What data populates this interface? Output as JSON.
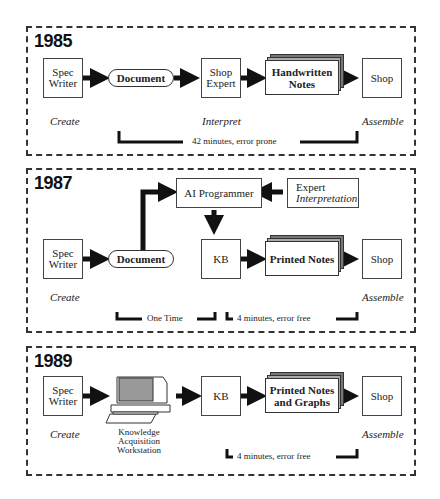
{
  "panels": [
    {
      "year": "1985",
      "nodes": {
        "spec_writer": "Spec Writer",
        "document": "Document",
        "shop_expert": "Shop Expert",
        "notes": "Handwritten Notes",
        "shop": "Shop"
      },
      "stages": {
        "create": "Create",
        "interpret": "Interpret",
        "assemble": "Assemble"
      },
      "timing": "42 minutes, error prone"
    },
    {
      "year": "1987",
      "nodes": {
        "ai_programmer": "AI Programmer",
        "expert_line1": "Expert",
        "expert_line2": "Interpretation",
        "spec_writer": "Spec Writer",
        "document": "Document",
        "kb": "KB",
        "notes": "Printed Notes",
        "shop": "Shop"
      },
      "stages": {
        "create": "Create",
        "assemble": "Assemble"
      },
      "timing_one": "One Time",
      "timing_two": "4 minutes, error free"
    },
    {
      "year": "1989",
      "nodes": {
        "spec_writer": "Spec Writer",
        "workstation": "Knowledge Acquisition Workstation",
        "kb": "KB",
        "notes": "Printed Notes and Graphs",
        "shop": "Shop"
      },
      "stages": {
        "create": "Create",
        "assemble": "Assemble"
      },
      "timing": "4 minutes, error free"
    }
  ]
}
